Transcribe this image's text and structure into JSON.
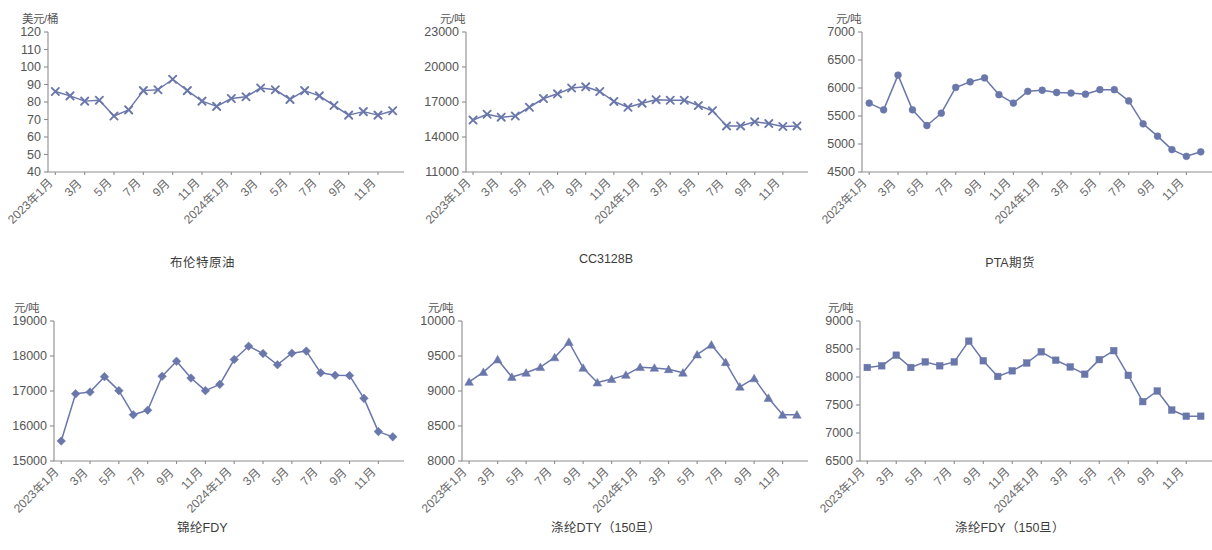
{
  "page": {
    "background_color": "#ffffff",
    "series_color": "#6a77ab",
    "axis_color": "#8d8d8d",
    "text_color": "#555555"
  },
  "x_categories": [
    "2023年1月",
    "",
    "3月",
    "",
    "5月",
    "",
    "7月",
    "",
    "9月",
    "",
    "11月",
    "",
    "2024年1月",
    "",
    "3月",
    "",
    "5月",
    "",
    "7月",
    "",
    "9月",
    "",
    "11月",
    ""
  ],
  "x_tick_labels": [
    "2023年1月",
    "3月",
    "5月",
    "7月",
    "9月",
    "11月",
    "2024年1月",
    "3月",
    "5月",
    "7月",
    "9月",
    "11月"
  ],
  "charts": [
    {
      "id": "brent-crude",
      "caption": "布伦特原油",
      "unit": "美元/桶",
      "marker": "x",
      "chart_data": {
        "type": "line",
        "title": "布伦特原油",
        "xlabel": "",
        "ylabel": "美元/桶",
        "ylim": [
          40,
          120
        ],
        "yticks": [
          40,
          50,
          60,
          70,
          80,
          90,
          100,
          110,
          120
        ],
        "ytick_labels": [
          "40",
          "50",
          "60",
          "70",
          "80",
          "90",
          "100",
          "110",
          "120"
        ],
        "grid": false,
        "legend": "none",
        "categories": [
          "2023年1月",
          "2023年2月",
          "2023年3月",
          "2023年4月",
          "2023年5月",
          "2023年6月",
          "2023年7月",
          "2023年8月",
          "2023年9月",
          "2023年10月",
          "2023年11月",
          "2023年12月",
          "2024年1月",
          "2024年2月",
          "2024年3月",
          "2024年4月",
          "2024年5月",
          "2024年6月",
          "2024年7月",
          "2024年8月",
          "2024年9月",
          "2024年10月",
          "2024年11月",
          "2024年12月"
        ],
        "values": [
          86,
          83.5,
          80.5,
          81,
          72,
          75.5,
          86.5,
          87,
          93,
          86.5,
          80.5,
          77.5,
          82,
          83,
          88,
          87,
          81.5,
          86.5,
          83.5,
          78,
          72.5,
          74.5,
          72.5,
          75
        ]
      }
    },
    {
      "id": "cc3128b",
      "caption": "CC3128B",
      "unit": "元/吨",
      "marker": "x",
      "chart_data": {
        "type": "line",
        "title": "CC3128B",
        "xlabel": "",
        "ylabel": "元/吨",
        "ylim": [
          11000,
          23000
        ],
        "yticks": [
          11000,
          14000,
          17000,
          20000,
          23000
        ],
        "ytick_labels": [
          "11000",
          "14000",
          "17000",
          "20000",
          "23000"
        ],
        "grid": false,
        "legend": "none",
        "categories": [
          "2023年1月",
          "2023年2月",
          "2023年3月",
          "2023年4月",
          "2023年5月",
          "2023年6月",
          "2023年7月",
          "2023年8月",
          "2023年9月",
          "2023年10月",
          "2023年11月",
          "2023年12月",
          "2024年1月",
          "2024年2月",
          "2024年3月",
          "2024年4月",
          "2024年5月",
          "2024年6月",
          "2024年7月",
          "2024年8月",
          "2024年9月",
          "2024年10月",
          "2024年11月",
          "2024年12月"
        ],
        "values": [
          15450,
          15950,
          15700,
          15800,
          16550,
          17300,
          17700,
          18200,
          18300,
          17900,
          17050,
          16550,
          16900,
          17200,
          17150,
          17150,
          16700,
          16250,
          14950,
          14950,
          15300,
          15150,
          14900,
          14950
        ]
      }
    },
    {
      "id": "pta-futures",
      "caption": "PTA期货",
      "unit": "元/吨",
      "marker": "circle",
      "chart_data": {
        "type": "line",
        "title": "PTA期货",
        "xlabel": "",
        "ylabel": "元/吨",
        "ylim": [
          4500,
          7000
        ],
        "yticks": [
          4500,
          5000,
          5500,
          6000,
          6500,
          7000
        ],
        "ytick_labels": [
          "4500",
          "5000",
          "5500",
          "6000",
          "6500",
          "7000"
        ],
        "grid": false,
        "legend": "none",
        "categories": [
          "2023年1月",
          "2023年2月",
          "2023年3月",
          "2023年4月",
          "2023年5月",
          "2023年6月",
          "2023年7月",
          "2023年8月",
          "2023年9月",
          "2023年10月",
          "2023年11月",
          "2023年12月",
          "2024年1月",
          "2024年2月",
          "2024年3月",
          "2024年4月",
          "2024年5月",
          "2024年6月",
          "2024年7月",
          "2024年8月",
          "2024年9月",
          "2024年10月",
          "2024年11月",
          "2024年12月"
        ],
        "values": [
          5730,
          5610,
          6230,
          5610,
          5330,
          5550,
          6010,
          6110,
          6180,
          5880,
          5730,
          5940,
          5960,
          5920,
          5910,
          5890,
          5970,
          5970,
          5770,
          5360,
          5140,
          4900,
          4780,
          4860
        ]
      }
    },
    {
      "id": "nylon-fdy",
      "caption": "锦纶FDY",
      "unit": "元/吨",
      "marker": "diamond",
      "chart_data": {
        "type": "line",
        "title": "锦纶FDY",
        "xlabel": "",
        "ylabel": "元/吨",
        "ylim": [
          15000,
          19000
        ],
        "yticks": [
          15000,
          16000,
          17000,
          18000,
          19000
        ],
        "ytick_labels": [
          "15000",
          "16000",
          "17000",
          "18000",
          "19000"
        ],
        "grid": false,
        "legend": "none",
        "categories": [
          "2023年1月",
          "2023年2月",
          "2023年3月",
          "2023年4月",
          "2023年5月",
          "2023年6月",
          "2023年7月",
          "2023年8月",
          "2023年9月",
          "2023年10月",
          "2023年11月",
          "2023年12月",
          "2024年1月",
          "2024年2月",
          "2024年3月",
          "2024年4月",
          "2024年5月",
          "2024年6月",
          "2024年7月",
          "2024年8月",
          "2024年9月",
          "2024年10月",
          "2024年11月",
          "2024年12月"
        ],
        "values": [
          15570,
          16920,
          16970,
          17410,
          17010,
          16320,
          16450,
          17420,
          17850,
          17370,
          17010,
          17190,
          17900,
          18280,
          18070,
          17750,
          18080,
          18140,
          17520,
          17450,
          17440,
          16790,
          15840,
          15690
        ]
      }
    },
    {
      "id": "polyester-dty",
      "caption": "涤纶DTY（150旦）",
      "unit": "元/吨",
      "marker": "triangle",
      "chart_data": {
        "type": "line",
        "title": "涤纶DTY（150旦）",
        "xlabel": "",
        "ylabel": "元/吨",
        "ylim": [
          8000,
          10000
        ],
        "yticks": [
          8000,
          8500,
          9000,
          9500,
          10000
        ],
        "ytick_labels": [
          "8000",
          "8500",
          "9000",
          "9500",
          "10000"
        ],
        "grid": false,
        "legend": "none",
        "categories": [
          "2023年1月",
          "2023年2月",
          "2023年3月",
          "2023年4月",
          "2023年5月",
          "2023年6月",
          "2023年7月",
          "2023年8月",
          "2023年9月",
          "2023年10月",
          "2023年11月",
          "2023年12月",
          "2024年1月",
          "2024年2月",
          "2024年3月",
          "2024年4月",
          "2024年5月",
          "2024年6月",
          "2024年7月",
          "2024年8月",
          "2024年9月",
          "2024年10月",
          "2024年11月",
          "2024年12月"
        ],
        "values": [
          9130,
          9270,
          9450,
          9200,
          9260,
          9340,
          9480,
          9700,
          9330,
          9120,
          9170,
          9230,
          9340,
          9330,
          9310,
          9260,
          9520,
          9660,
          9410,
          9060,
          9180,
          8900,
          8660,
          8660
        ]
      }
    },
    {
      "id": "polyester-fdy",
      "caption": "涤纶FDY（150旦）",
      "unit": "元/吨",
      "marker": "square",
      "chart_data": {
        "type": "line",
        "title": "涤纶FDY（150旦）",
        "xlabel": "",
        "ylabel": "元/吨",
        "ylim": [
          6500,
          9000
        ],
        "yticks": [
          6500,
          7000,
          7500,
          8000,
          8500,
          9000
        ],
        "ytick_labels": [
          "6500",
          "7000",
          "7500",
          "8000",
          "8500",
          "9000"
        ],
        "grid": false,
        "legend": "none",
        "categories": [
          "2023年1月",
          "2023年2月",
          "2023年3月",
          "2023年4月",
          "2023年5月",
          "2023年6月",
          "2023年7月",
          "2023年8月",
          "2023年9月",
          "2023年10月",
          "2023年11月",
          "2023年12月",
          "2024年1月",
          "2024年2月",
          "2024年3月",
          "2024年4月",
          "2024年5月",
          "2024年6月",
          "2024年7月",
          "2024年8月",
          "2024年9月",
          "2024年10月",
          "2024年11月",
          "2024年12月"
        ],
        "values": [
          8170,
          8200,
          8390,
          8170,
          8270,
          8200,
          8270,
          8640,
          8290,
          8010,
          8110,
          8250,
          8450,
          8300,
          8180,
          8050,
          8310,
          8470,
          8030,
          7560,
          7750,
          7410,
          7300,
          7300
        ]
      }
    }
  ]
}
